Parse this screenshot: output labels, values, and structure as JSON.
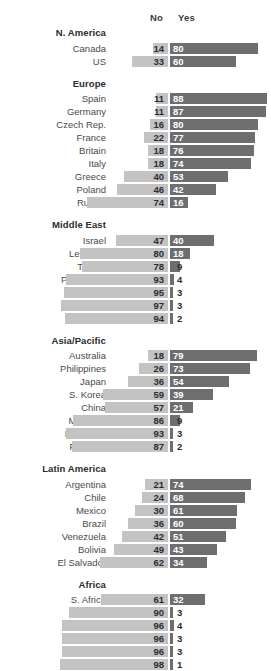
{
  "chart_data": {
    "type": "bar",
    "subtype": "diverging-stacked-bar",
    "title": "",
    "xlabel": "",
    "ylabel": "",
    "legend": [
      "No",
      "Yes"
    ],
    "legend_position": "top",
    "grid": false,
    "xlim": [
      0,
      100
    ],
    "colors": {
      "no": "#c3c3c3",
      "yes": "#6e6e6e",
      "label": "#4a4a4a",
      "header": "#2b2b2b"
    },
    "columns": [
      "No",
      "Yes"
    ],
    "groups": [
      {
        "name": "N. America",
        "rows": [
          {
            "label": "Canada",
            "no": 14,
            "yes": 80
          },
          {
            "label": "US",
            "no": 33,
            "yes": 60
          }
        ]
      },
      {
        "name": "Europe",
        "rows": [
          {
            "label": "Spain",
            "no": 11,
            "yes": 88
          },
          {
            "label": "Germany",
            "no": 11,
            "yes": 87
          },
          {
            "label": "Czech Rep.",
            "no": 16,
            "yes": 80
          },
          {
            "label": "France",
            "no": 22,
            "yes": 77
          },
          {
            "label": "Britain",
            "no": 18,
            "yes": 76
          },
          {
            "label": "Italy",
            "no": 18,
            "yes": 74
          },
          {
            "label": "Greece",
            "no": 40,
            "yes": 53
          },
          {
            "label": "Poland",
            "no": 46,
            "yes": 42
          },
          {
            "label": "Russia",
            "no": 74,
            "yes": 16
          }
        ]
      },
      {
        "name": "Middle East",
        "rows": [
          {
            "label": "Israel",
            "no": 47,
            "yes": 40
          },
          {
            "label": "Lebanon",
            "no": 80,
            "yes": 18
          },
          {
            "label": "Turkey",
            "no": 78,
            "yes": 9
          },
          {
            "label": "Palest. ter.",
            "no": 93,
            "yes": 4
          },
          {
            "label": "Egypt",
            "no": 95,
            "yes": 3
          },
          {
            "label": "Jordan",
            "no": 97,
            "yes": 3
          },
          {
            "label": "Tunisia",
            "no": 94,
            "yes": 2
          }
        ]
      },
      {
        "name": "Asia/Pacific",
        "rows": [
          {
            "label": "Australia",
            "no": 18,
            "yes": 79
          },
          {
            "label": "Philippines",
            "no": 26,
            "yes": 73
          },
          {
            "label": "Japan",
            "no": 36,
            "yes": 54
          },
          {
            "label": "S. Korea",
            "no": 59,
            "yes": 39
          },
          {
            "label": "China",
            "no": 57,
            "yes": 21
          },
          {
            "label": "Malaysia",
            "no": 86,
            "yes": 9
          },
          {
            "label": "Indonesia",
            "no": 93,
            "yes": 3
          },
          {
            "label": "Pakistan",
            "no": 87,
            "yes": 2
          }
        ]
      },
      {
        "name": "Latin America",
        "rows": [
          {
            "label": "Argentina",
            "no": 21,
            "yes": 74
          },
          {
            "label": "Chile",
            "no": 24,
            "yes": 68
          },
          {
            "label": "Mexico",
            "no": 30,
            "yes": 61
          },
          {
            "label": "Brazil",
            "no": 36,
            "yes": 60
          },
          {
            "label": "Venezuela",
            "no": 42,
            "yes": 51
          },
          {
            "label": "Bolivia",
            "no": 49,
            "yes": 43
          },
          {
            "label": "El Salvador",
            "no": 62,
            "yes": 34
          }
        ]
      },
      {
        "name": "Africa",
        "rows": [
          {
            "label": "S. Africa",
            "no": 61,
            "yes": 32
          },
          {
            "label": "Kenya",
            "no": 90,
            "yes": 3
          },
          {
            "label": "Uganda",
            "no": 96,
            "yes": 4
          },
          {
            "label": "Ghana",
            "no": 96,
            "yes": 3
          },
          {
            "label": "Senegal",
            "no": 96,
            "yes": 3
          },
          {
            "label": "Nigeria",
            "no": 98,
            "yes": 1
          }
        ]
      }
    ]
  }
}
